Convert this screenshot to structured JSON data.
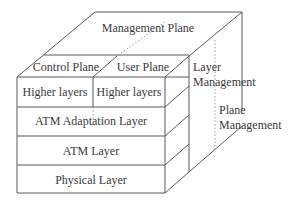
{
  "diagram": {
    "planes": {
      "management": "Management Plane",
      "control": "Control Plane",
      "user": "User Plane"
    },
    "front_layers": {
      "higher_left": "Higher layers",
      "higher_right": "Higher layers",
      "aal": "ATM Adaptation Layer",
      "atm": "ATM Layer",
      "physical": "Physical Layer"
    },
    "side_labels": {
      "layer_management_line1": "Layer",
      "layer_management_line2": "Management",
      "plane_management_line1": "Plane",
      "plane_management_line2": "Management"
    },
    "colors": {
      "line": "#5a5a5a",
      "dotted": "#9a9a9a",
      "text": "#3a3a3a",
      "background": "#ffffff"
    }
  }
}
